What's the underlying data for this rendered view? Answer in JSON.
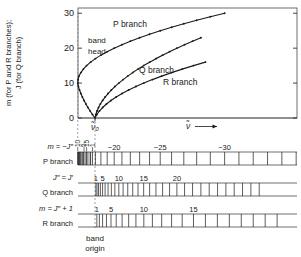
{
  "figure": {
    "kind": "fortrat-diagram",
    "axes": {
      "ylabel_line1": "m (for P and R branches);",
      "ylabel_line2": "J (for Q branch)",
      "yticks": [
        "0",
        "10",
        "20",
        "30"
      ],
      "ytick_values": [
        0,
        10,
        20,
        30
      ],
      "ylim": [
        0,
        31.5
      ],
      "xlabel": "ν̃",
      "xlabel_arrow": "⟶",
      "band_origin_tick": "ν̃₀"
    },
    "annotations": [
      {
        "name": "band-head",
        "line1": "band",
        "line2": "head"
      },
      {
        "name": "p-branch-curve-label",
        "text": "P branch"
      },
      {
        "name": "q-branch-curve-label",
        "text": "Q branch"
      },
      {
        "name": "r-branch-curve-label",
        "text": "R branch"
      }
    ],
    "caption": {
      "line1": "band",
      "line2": "origin"
    }
  },
  "chart_data": {
    "type": "line",
    "title": "",
    "xlabel": "ν̃",
    "ylabel": "m (for P and R branches); J (for Q branch)",
    "ylim": [
      0,
      31.5
    ],
    "grid": false,
    "legend": "inline-annotations",
    "band_origin_x": 0,
    "series": [
      {
        "name": "P branch",
        "comment": "parabolic branch turning back at the band head",
        "points": [
          [
            0.0,
            0.0
          ],
          [
            -0.3,
            1
          ],
          [
            -0.58,
            2
          ],
          [
            -0.84,
            3
          ],
          [
            -1.08,
            4
          ],
          [
            -1.3,
            5
          ],
          [
            -1.5,
            6
          ],
          [
            -1.68,
            7
          ],
          [
            -1.84,
            8
          ],
          [
            -1.97,
            9
          ],
          [
            -2.05,
            10
          ],
          [
            -2.02,
            11
          ],
          [
            -1.9,
            12
          ],
          [
            -1.68,
            13
          ],
          [
            -1.38,
            14
          ],
          [
            -1.0,
            15
          ],
          [
            -0.52,
            16
          ],
          [
            0.05,
            17
          ],
          [
            0.7,
            18
          ],
          [
            1.45,
            19
          ],
          [
            2.28,
            20
          ],
          [
            3.2,
            21
          ],
          [
            4.2,
            22
          ],
          [
            5.3,
            23
          ],
          [
            6.48,
            24
          ],
          [
            7.75,
            25
          ],
          [
            9.1,
            26
          ],
          [
            10.55,
            27
          ],
          [
            12.08,
            28
          ],
          [
            13.7,
            29
          ],
          [
            15.4,
            30
          ]
        ]
      },
      {
        "name": "Q branch",
        "comment": "rises steeply from the band origin",
        "points": [
          [
            0.0,
            0.0
          ],
          [
            0.1,
            1
          ],
          [
            0.24,
            2
          ],
          [
            0.42,
            3
          ],
          [
            0.64,
            4
          ],
          [
            0.9,
            5
          ],
          [
            1.2,
            6
          ],
          [
            1.55,
            7
          ],
          [
            1.94,
            8
          ],
          [
            2.36,
            9
          ],
          [
            2.83,
            10
          ],
          [
            3.34,
            11
          ],
          [
            3.89,
            12
          ],
          [
            4.48,
            13
          ],
          [
            5.11,
            14
          ],
          [
            5.78,
            15
          ],
          [
            6.49,
            16
          ],
          [
            7.24,
            17
          ],
          [
            8.03,
            18
          ],
          [
            8.86,
            19
          ],
          [
            9.73,
            20
          ],
          [
            10.64,
            21
          ],
          [
            11.59,
            22
          ],
          [
            12.58,
            23
          ]
        ]
      },
      {
        "name": "R branch",
        "comment": "shallow branch rising from the band origin",
        "points": [
          [
            0.0,
            0.0
          ],
          [
            0.22,
            1
          ],
          [
            0.52,
            2
          ],
          [
            0.9,
            3
          ],
          [
            1.36,
            4
          ],
          [
            1.9,
            5
          ],
          [
            2.52,
            6
          ],
          [
            3.22,
            7
          ],
          [
            4.0,
            8
          ],
          [
            4.86,
            9
          ],
          [
            5.8,
            10
          ],
          [
            6.82,
            11
          ],
          [
            7.92,
            12
          ],
          [
            9.1,
            13
          ],
          [
            10.36,
            14
          ],
          [
            11.7,
            15
          ],
          [
            13.12,
            16
          ]
        ]
      }
    ]
  },
  "scales": [
    {
      "id": "p-branch",
      "row_label": "m = −J″",
      "name_label": "P branch",
      "tick_labels": [
        "−20",
        "−25",
        "−30"
      ],
      "tick_label_values": [
        -20,
        -25,
        -30
      ],
      "head_labels": [
        "10",
        "5",
        "15",
        "1"
      ]
    },
    {
      "id": "q-branch",
      "row_label": "J″ = J′",
      "name_label": "Q branch",
      "tick_labels": [
        "1",
        "5",
        "10",
        "15",
        "20"
      ],
      "tick_label_values": [
        1,
        5,
        10,
        15,
        20
      ]
    },
    {
      "id": "r-branch",
      "row_label": "m = J″ + 1",
      "name_label": "R branch",
      "tick_labels": [
        "1",
        "5",
        "10",
        "15"
      ],
      "tick_label_values": [
        1,
        5,
        10,
        15
      ]
    }
  ],
  "colors": {
    "ink": "#1a1a1a",
    "frame": "#4a4a4a",
    "dashed": "#8a8a8a",
    "background": "#ffffff"
  }
}
